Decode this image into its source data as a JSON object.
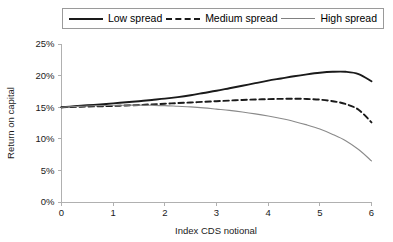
{
  "chart_data": {
    "type": "line",
    "title": "",
    "xlabel": "Index CDS notional",
    "ylabel": "Return on capital",
    "xlim": [
      0,
      6
    ],
    "ylim": [
      0,
      25
    ],
    "grid": false,
    "legend_position": "top",
    "x_ticks": [
      "0",
      "1",
      "2",
      "3",
      "4",
      "5",
      "6"
    ],
    "x_tick_values": [
      0,
      1,
      2,
      3,
      4,
      5,
      6
    ],
    "y_ticks": [
      "0%",
      "5%",
      "10%",
      "15%",
      "20%",
      "25%"
    ],
    "y_tick_values": [
      0,
      5,
      10,
      15,
      20,
      25
    ],
    "x": [
      0,
      0.25,
      0.5,
      0.75,
      1,
      1.25,
      1.5,
      1.75,
      2,
      2.25,
      2.5,
      2.75,
      3,
      3.25,
      3.5,
      3.75,
      4,
      4.25,
      4.5,
      4.75,
      5,
      5.25,
      5.5,
      5.75,
      6
    ],
    "series": [
      {
        "name": "Low spread",
        "style": "solid-thick",
        "color": "#1a1a1a",
        "values": [
          15.0,
          15.15,
          15.3,
          15.45,
          15.6,
          15.78,
          15.95,
          16.15,
          16.35,
          16.6,
          16.9,
          17.25,
          17.6,
          18.0,
          18.4,
          18.8,
          19.2,
          19.55,
          19.9,
          20.2,
          20.45,
          20.6,
          20.6,
          20.25,
          19.1
        ]
      },
      {
        "name": "Medium spread",
        "style": "dashed",
        "color": "#1a1a1a",
        "values": [
          15.0,
          15.05,
          15.1,
          15.15,
          15.2,
          15.28,
          15.35,
          15.45,
          15.55,
          15.65,
          15.75,
          15.85,
          15.95,
          16.05,
          16.15,
          16.22,
          16.28,
          16.32,
          16.34,
          16.3,
          16.2,
          15.95,
          15.5,
          14.6,
          12.6
        ]
      },
      {
        "name": "High spread",
        "style": "solid-thin",
        "color": "#8a8a8a",
        "values": [
          15.0,
          15.1,
          15.2,
          15.25,
          15.3,
          15.32,
          15.33,
          15.3,
          15.25,
          15.15,
          15.05,
          14.9,
          14.7,
          14.5,
          14.25,
          13.95,
          13.6,
          13.2,
          12.75,
          12.2,
          11.55,
          10.7,
          9.7,
          8.3,
          6.5
        ]
      }
    ]
  },
  "legend": {
    "items": [
      {
        "label": "Low spread",
        "style": "solid-thick"
      },
      {
        "label": "Medium spread",
        "style": "dashed"
      },
      {
        "label": "High spread",
        "style": "solid-thin"
      }
    ]
  }
}
